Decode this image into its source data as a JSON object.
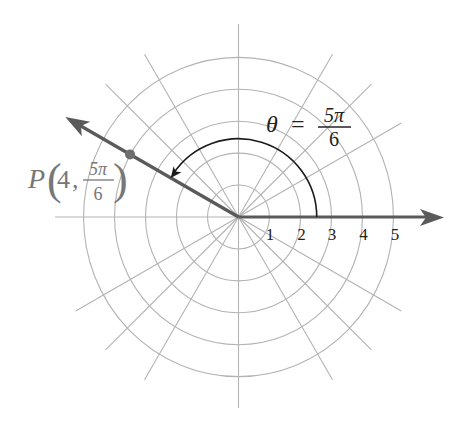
{
  "diagram": {
    "type": "polar-coordinate-plot",
    "center": {
      "x": 238.5,
      "y": 217
    },
    "unit_px": 31.3,
    "rings": [
      1,
      2,
      3,
      4,
      5
    ],
    "radial_angles_deg": [
      0,
      30,
      45,
      60,
      90,
      120,
      135,
      150,
      180,
      210,
      225,
      240,
      270,
      300,
      315,
      330
    ],
    "radial_length_px": 188,
    "axis_labels": [
      "1",
      "2",
      "3",
      "4",
      "5"
    ],
    "colors": {
      "grid": "#b3b3b3",
      "ray": "#5a5a5a",
      "arc": "#1a1a1a",
      "point": "#6e6e6e",
      "point_label": "#777777",
      "text": "#222222"
    },
    "angle_label": {
      "symbol": "θ",
      "equals": "=",
      "numerator": "5π",
      "denominator": "6"
    },
    "point": {
      "name": "P",
      "r": "4",
      "comma": ",",
      "theta_numerator": "5π",
      "theta_denominator": "6",
      "r_value": 4,
      "theta_deg": 150
    },
    "angle_arc": {
      "radius_units": 2.5,
      "from_deg": 0,
      "to_deg": 150
    }
  }
}
